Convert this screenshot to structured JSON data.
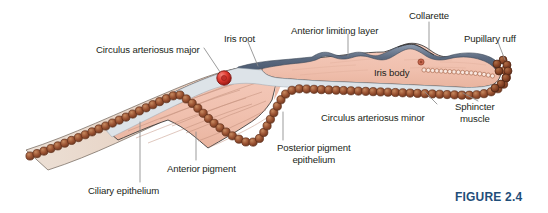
{
  "figure": {
    "caption": "FIGURE 2.4",
    "caption_color": "#1f4e79",
    "background": "#ffffff",
    "width": 548,
    "height": 213
  },
  "palette": {
    "iris_stroma": "#f2c3b2",
    "iris_stroma_dark": "#e8b4a2",
    "ciliary_body": "#e5d3c6",
    "stroma_line": "#b9806d",
    "anterior_limiting_layer": "#5d6b80",
    "anterior_limiting_layer_light": "#8c99ab",
    "pigment_bead": "#9b5333",
    "pigment_bead_dark": "#7d3f24",
    "pigment_bead_light": "#c07a51",
    "posterior_epithelium_pale": "#dde3e8",
    "circulus_major": "#e03a30",
    "circulus_major_dark": "#a8211a",
    "circulus_minor": "#b5563f",
    "sphincter_bead": "#f6e2da",
    "sphincter_outline": "#9b5333",
    "outline": "#2b2b2b",
    "leader_line": "#8a8a8a",
    "text": "#231f20"
  },
  "labels": [
    {
      "id": "circulus-arteriosus-major",
      "text": "Circulus arteriosus major",
      "x": 96,
      "y": 44,
      "align": "left"
    },
    {
      "id": "iris-root",
      "text": "Iris root",
      "x": 224,
      "y": 33,
      "align": "left"
    },
    {
      "id": "anterior-limiting-layer",
      "text": "Anterior limiting layer",
      "x": 291,
      "y": 25,
      "align": "left"
    },
    {
      "id": "collarette",
      "text": "Collarette",
      "x": 409,
      "y": 10,
      "align": "left"
    },
    {
      "id": "pupillary-ruff",
      "text": "Pupillary ruff",
      "x": 464,
      "y": 33,
      "align": "left"
    },
    {
      "id": "iris-body",
      "text": "Iris body",
      "x": 374,
      "y": 67,
      "align": "left"
    },
    {
      "id": "circulus-arteriosus-minor",
      "text": "Circulus arteriosus minor",
      "x": 321,
      "y": 112,
      "align": "left"
    },
    {
      "id": "sphincter-muscle",
      "text": "Sphincter\nmuscle",
      "x": 455,
      "y": 101,
      "align": "left"
    },
    {
      "id": "posterior-pigment-epithelium",
      "text": "Posterior pigment\nepithelium",
      "x": 277,
      "y": 142,
      "align": "left"
    },
    {
      "id": "anterior-pigment",
      "text": "Anterior pigment",
      "x": 167,
      "y": 163,
      "align": "left"
    },
    {
      "id": "ciliary-epithelium",
      "text": "Ciliary epithelium",
      "x": 88,
      "y": 185,
      "align": "left"
    }
  ],
  "structures": [
    {
      "id": "ciliary-body-wedge",
      "name": "ciliary body wedge"
    },
    {
      "id": "iris-stroma",
      "name": "iris stroma / iris body"
    },
    {
      "id": "anterior-limiting-layer",
      "name": "anterior limiting layer band"
    },
    {
      "id": "posterior-pigment-epithelium",
      "name": "posterior pigment epithelium bead chain"
    },
    {
      "id": "anterior-pigment-layer",
      "name": "anterior pigment epithelium pale layer"
    },
    {
      "id": "circulus-arteriosus-major",
      "name": "circulus arteriosus major vessel"
    },
    {
      "id": "circulus-arteriosus-minor",
      "name": "circulus arteriosus minor vessel"
    },
    {
      "id": "sphincter-muscle",
      "name": "sphincter muscle bundle"
    },
    {
      "id": "pupillary-ruff",
      "name": "pupillary ruff"
    },
    {
      "id": "collarette",
      "name": "collarette ridge"
    }
  ]
}
